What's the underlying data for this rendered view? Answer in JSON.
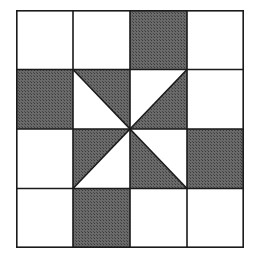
{
  "diagram": {
    "grid": {
      "rows": 4,
      "cols": 4
    },
    "colors": {
      "dark": "#5a5a5a",
      "light": "#ffffff",
      "line": "#1a1a1a"
    },
    "cells": [
      [
        "light",
        "light",
        "dark",
        "light"
      ],
      [
        "dark",
        "tri-tl-br:tr-dark",
        "tri-bl-tr:br-dark",
        "light"
      ],
      [
        "light",
        "tri-tr-bl:tl-dark",
        "tri-tl-br:bl-dark",
        "dark"
      ],
      [
        "light",
        "dark",
        "light",
        "light"
      ]
    ]
  },
  "caption": ""
}
